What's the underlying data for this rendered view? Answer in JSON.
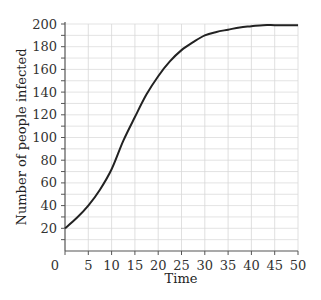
{
  "chart_data": {
    "type": "line",
    "title": "",
    "xlabel": "Time",
    "ylabel": "Number of people infected",
    "xlim": [
      0,
      50
    ],
    "ylim": [
      0,
      200
    ],
    "grid": true,
    "legend": null,
    "x_ticks": [
      0,
      5,
      10,
      15,
      20,
      25,
      30,
      35,
      40,
      45,
      50
    ],
    "y_ticks": [
      20,
      40,
      60,
      80,
      100,
      120,
      140,
      160,
      180,
      200
    ],
    "series": [
      {
        "name": "infected",
        "color": "#222222",
        "x": [
          0,
          2.5,
          5,
          7.5,
          10,
          12.5,
          15,
          17.5,
          20,
          22.5,
          25,
          27.5,
          30,
          32.5,
          35,
          37.5,
          40,
          42.5,
          45,
          47.5,
          50
        ],
        "y": [
          20,
          29,
          40,
          54,
          72,
          97,
          118,
          138,
          154,
          167,
          177,
          184,
          190,
          193,
          195,
          197,
          198,
          199,
          199,
          199,
          199
        ]
      }
    ]
  }
}
